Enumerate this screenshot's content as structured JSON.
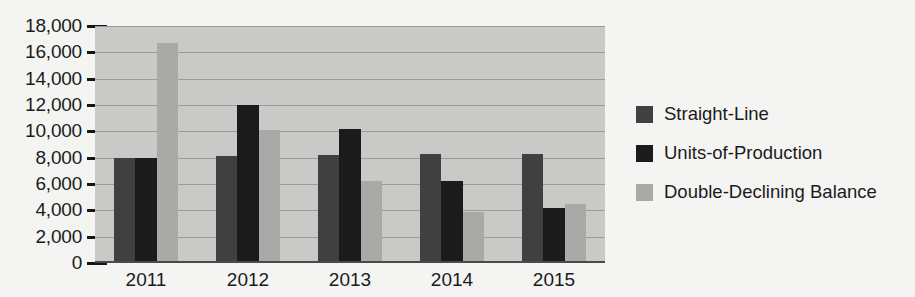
{
  "chart_data": {
    "type": "bar",
    "title": "",
    "xlabel": "",
    "ylabel": "",
    "categories": [
      "2011",
      "2012",
      "2013",
      "2014",
      "2015"
    ],
    "series": [
      {
        "name": "Straight-Line",
        "color": "#404040",
        "values": [
          8000,
          8100,
          8200,
          8300,
          8300
        ]
      },
      {
        "name": "Units-of-Production",
        "color": "#1b1b1b",
        "values": [
          8000,
          12000,
          10200,
          6200,
          4200
        ]
      },
      {
        "name": "Double-Declining Balance",
        "color": "#a9a9a7",
        "values": [
          16700,
          10100,
          6200,
          3900,
          4500
        ]
      }
    ],
    "ylim": [
      0,
      18000
    ],
    "ytick_values": [
      18000,
      16000,
      14000,
      12000,
      10000,
      8000,
      6000,
      4000,
      2000,
      0
    ],
    "ytick_labels": [
      "18,000",
      "16,000",
      "14,000",
      "12,000",
      "10,000",
      "8,000",
      "6,000",
      "4,000",
      "2,000",
      "0"
    ],
    "grid": true,
    "legend_position": "right",
    "plot_background": "#c9c9c7",
    "page_background": "#f4f4f2"
  }
}
